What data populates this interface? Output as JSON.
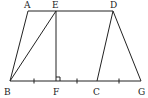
{
  "diagram": {
    "type": "geometry",
    "labels": {
      "A": "A",
      "E": "E",
      "D": "D",
      "B": "B",
      "F": "F",
      "C": "C",
      "G": "G"
    },
    "segments": [
      "AE",
      "ED",
      "AB",
      "BE",
      "EF",
      "DC",
      "DG",
      "BG"
    ],
    "equal_marks": [
      "BF",
      "FC",
      "CG"
    ],
    "right_angle": "EFC",
    "line_color": "#222222"
  }
}
